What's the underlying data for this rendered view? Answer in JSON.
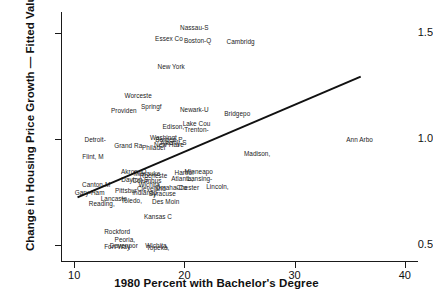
{
  "chart_data": {
    "type": "scatter",
    "title": "",
    "xlabel": "1980 Percent with Bachelor's Degree",
    "ylabel": "Change in Housing Price Growth — Fitted Values",
    "xlim": [
      8.8,
      41.2
    ],
    "ylim": [
      0.42,
      1.6
    ],
    "xticks": [
      10,
      20,
      30,
      40
    ],
    "xtick_labels": [
      "10",
      "20",
      "30",
      "40"
    ],
    "yticks": [
      0.5,
      1.0,
      1.5
    ],
    "ytick_labels": [
      "0.5",
      "1.0",
      "1.5"
    ],
    "grid": false,
    "legend": null,
    "point_marker": "text-label",
    "fit_line": {
      "name": "fitted regression line",
      "x": [
        10.3,
        36.0
      ],
      "y": [
        0.725,
        1.295
      ],
      "color": "#111111",
      "width": 2.0
    },
    "points": [
      {
        "label": "Nassau-S",
        "x": 20.9,
        "y": 1.53
      },
      {
        "label": "Essex Co",
        "x": 18.6,
        "y": 1.475
      },
      {
        "label": "Boston-Q",
        "x": 21.2,
        "y": 1.47
      },
      {
        "label": "Cambridg",
        "x": 25.1,
        "y": 1.462
      },
      {
        "label": "New York",
        "x": 18.8,
        "y": 1.345
      },
      {
        "label": "Worceste",
        "x": 15.8,
        "y": 1.208
      },
      {
        "label": "Springf",
        "x": 17.0,
        "y": 1.155
      },
      {
        "label": "Providen",
        "x": 14.5,
        "y": 1.138
      },
      {
        "label": "Newark-U",
        "x": 20.9,
        "y": 1.14
      },
      {
        "label": "Bridgepo",
        "x": 24.8,
        "y": 1.125
      },
      {
        "label": "Lake Cou",
        "x": 21.1,
        "y": 1.078
      },
      {
        "label": "Edison,",
        "x": 19.0,
        "y": 1.06
      },
      {
        "label": "Trenton-",
        "x": 21.1,
        "y": 1.048
      },
      {
        "label": "Detroit-",
        "x": 11.9,
        "y": 1.0
      },
      {
        "label": "Ann Arbo",
        "x": 35.9,
        "y": 1.0
      },
      {
        "label": "Washingt",
        "x": 18.1,
        "y": 1.012
      },
      {
        "label": "Bergen-P",
        "x": 18.6,
        "y": 1.0
      },
      {
        "label": "Albany-S",
        "x": 19.0,
        "y": 0.988
      },
      {
        "label": "New Have",
        "x": 18.6,
        "y": 0.978
      },
      {
        "label": "Grand Ra",
        "x": 14.9,
        "y": 0.973
      },
      {
        "label": "Philadel",
        "x": 17.2,
        "y": 0.962
      },
      {
        "label": "Madison,",
        "x": 26.6,
        "y": 0.935
      },
      {
        "label": "Flint, M",
        "x": 11.7,
        "y": 0.918
      },
      {
        "label": "Hartfor",
        "x": 20.0,
        "y": 0.845
      },
      {
        "label": "Minneapo",
        "x": 21.3,
        "y": 0.848
      },
      {
        "label": "Akron, O",
        "x": 15.4,
        "y": 0.848
      },
      {
        "label": "Milwauke",
        "x": 16.6,
        "y": 0.84
      },
      {
        "label": "Rocheste",
        "x": 17.2,
        "y": 0.832
      },
      {
        "label": "Atlanta,",
        "x": 19.8,
        "y": 0.818
      },
      {
        "label": "Lansing-",
        "x": 21.4,
        "y": 0.815
      },
      {
        "label": "Dayton-S",
        "x": 15.5,
        "y": 0.812
      },
      {
        "label": "Columbus",
        "x": 16.6,
        "y": 0.806
      },
      {
        "label": "Canton-M",
        "x": 12.0,
        "y": 0.79
      },
      {
        "label": "Wichita",
        "x": 16.8,
        "y": 0.788
      },
      {
        "label": "Lincoln,",
        "x": 23.0,
        "y": 0.778
      },
      {
        "label": "Omaha-Co",
        "x": 18.8,
        "y": 0.775
      },
      {
        "label": "Chester",
        "x": 20.3,
        "y": 0.772
      },
      {
        "label": "Cleveland",
        "x": 17.0,
        "y": 0.768
      },
      {
        "label": "Pittsbur",
        "x": 14.7,
        "y": 0.762
      },
      {
        "label": "Gary-Ham",
        "x": 11.4,
        "y": 0.752
      },
      {
        "label": "Indianap",
        "x": 16.4,
        "y": 0.752
      },
      {
        "label": "Syracuse",
        "x": 18.0,
        "y": 0.748
      },
      {
        "label": "Lancaste",
        "x": 13.6,
        "y": 0.722
      },
      {
        "label": "Toledo,",
        "x": 15.2,
        "y": 0.712
      },
      {
        "label": "Des Moin",
        "x": 18.3,
        "y": 0.71
      },
      {
        "label": "Reading,",
        "x": 12.5,
        "y": 0.7
      },
      {
        "label": "Kansas C",
        "x": 17.6,
        "y": 0.635
      },
      {
        "label": "Rockford",
        "x": 13.9,
        "y": 0.565
      },
      {
        "label": "Peoria,",
        "x": 14.6,
        "y": 0.528
      },
      {
        "label": "Davenpor",
        "x": 14.5,
        "y": 0.5
      },
      {
        "label": "Fort Way",
        "x": 13.9,
        "y": 0.495
      },
      {
        "label": "Wichita,",
        "x": 17.5,
        "y": 0.5
      },
      {
        "label": "Topeka,",
        "x": 17.6,
        "y": 0.49
      }
    ]
  }
}
